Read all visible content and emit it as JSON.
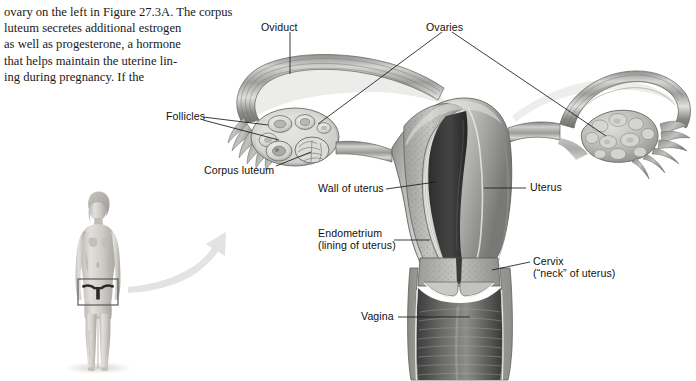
{
  "page": {
    "width": 696,
    "height": 381,
    "background": "#ffffff"
  },
  "body_text": {
    "lines": [
      "ovary on the left in Figure 27.3A. The corpus",
      "luteum secretes additional estrogen",
      "as well as progesterone, a hormone",
      "that helps maintain the uterine lin-",
      "ing during pregnancy. If the"
    ],
    "full_text": "ovary on the left in Figure 27.3A. The corpus luteum secretes additional estrogen as well as progesterone, a hormone that helps maintain the uterine lining during pregnancy. If the",
    "figure_reference": "Figure 27.3A"
  },
  "figure": {
    "labels": [
      {
        "id": "oviduct",
        "text": "Oviduct",
        "x": 261,
        "y": 21
      },
      {
        "id": "ovaries",
        "text": "Ovaries",
        "x": 426,
        "y": 21
      },
      {
        "id": "follicles",
        "text": "Follicles",
        "x": 166,
        "y": 114
      },
      {
        "id": "corpus-luteum",
        "text": "Corpus luteum",
        "x": 204,
        "y": 168
      },
      {
        "id": "wall-of-uterus",
        "text": "Wall of uterus",
        "x": 318,
        "y": 183
      },
      {
        "id": "endometrium",
        "text": "Endometrium",
        "x": 318,
        "y": 227
      },
      {
        "id": "endometrium-sub",
        "text": "(lining of uterus)",
        "x": 318,
        "y": 239
      },
      {
        "id": "uterus",
        "text": "Uterus",
        "x": 530,
        "y": 182
      },
      {
        "id": "cervix",
        "text": "Cervix",
        "x": 533,
        "y": 256
      },
      {
        "id": "cervix-sub",
        "text": "(“neck” of uterus)",
        "x": 533,
        "y": 268
      },
      {
        "id": "vagina",
        "text": "Vagina",
        "x": 361,
        "y": 311
      }
    ],
    "colors": {
      "line": "#1a1a1a",
      "label_text": "#111111",
      "tissue_light": "#d9d9d6",
      "tissue_mid": "#a9a9a6",
      "tissue_dark": "#6e6e6c",
      "cavity": "#3b3b3b",
      "body_skin": "#cfcdc9",
      "arrow": "#e2e2e2"
    }
  },
  "body_figure": {
    "description": "Full-body grayscale illustration of a standing female with pelvic region highlighted",
    "highlight_box": {
      "x": 78,
      "y": 279,
      "w": 40,
      "h": 26
    }
  },
  "arrow": {
    "description": "Curved gray arrow pointing from the body figure up toward the enlarged anatomical diagram"
  }
}
